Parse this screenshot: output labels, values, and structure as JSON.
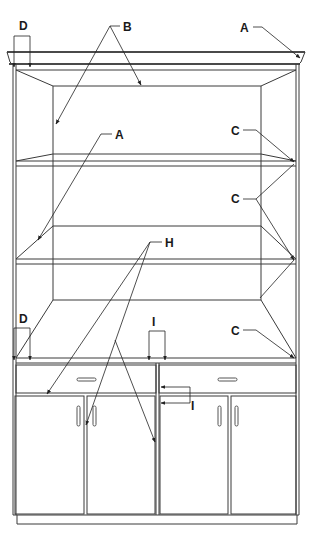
{
  "diagram": {
    "type": "exploded technical drawing",
    "colors": {
      "line": "#3a3a3a",
      "label": "#1a1a1a",
      "background": "#ffffff"
    },
    "callouts": [
      {
        "id": "A",
        "label": "A",
        "target": "crown moulding / top shelf edge"
      },
      {
        "id": "A2",
        "label": "A",
        "target": "adjustable shelf front edge"
      },
      {
        "id": "B",
        "label": "B",
        "target": "back panel and top inside edges"
      },
      {
        "id": "C1",
        "label": "C",
        "target": "upper shelf right end"
      },
      {
        "id": "C2",
        "label": "C",
        "target": "middle shelf right end"
      },
      {
        "id": "C3",
        "label": "C",
        "target": "bottom shelf right end"
      },
      {
        "id": "D1",
        "label": "D",
        "target": "top left side panel edge"
      },
      {
        "id": "D2",
        "label": "D",
        "target": "lower left side panel edge"
      },
      {
        "id": "H",
        "label": "H",
        "target": "drawer and door faces"
      },
      {
        "id": "I1",
        "label": "I",
        "target": "center divider top"
      },
      {
        "id": "I2",
        "label": "I",
        "target": "center divider at drawer rail"
      }
    ],
    "components": {
      "shelves": 3,
      "drawers": 2,
      "doors": 4
    }
  }
}
